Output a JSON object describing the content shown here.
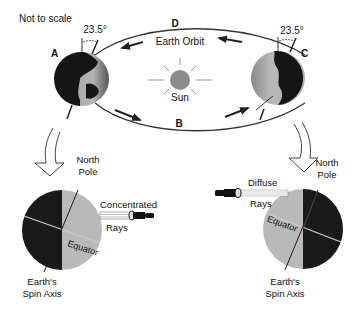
{
  "diagram": {
    "note": "Not to scale",
    "tilt_angle_left": "23.5°",
    "tilt_angle_right": "23.5°",
    "positions": {
      "a": "A",
      "b": "B",
      "c": "C",
      "d": "D"
    },
    "orbit_label": "Earth Orbit",
    "sun_label": "Sun",
    "left_detail": {
      "north_pole_line1": "North",
      "north_pole_line2": "Pole",
      "rays_line1": "Concentrated",
      "rays_line2": "Rays",
      "equator": "Equator",
      "axis_line1": "Earth's",
      "axis_line2": "Spin Axis"
    },
    "right_detail": {
      "north_pole_line1": "North",
      "north_pole_line2": "Pole",
      "rays_line1": "Diffuse",
      "rays_line2": "Rays",
      "equator": "Equator",
      "axis_line1": "Earth's",
      "axis_line2": "Spin Axis"
    },
    "colors": {
      "dark": "#1a1a1a",
      "light": "#b9b9b9",
      "sun": "#8c8c8c",
      "line": "#222222"
    }
  }
}
